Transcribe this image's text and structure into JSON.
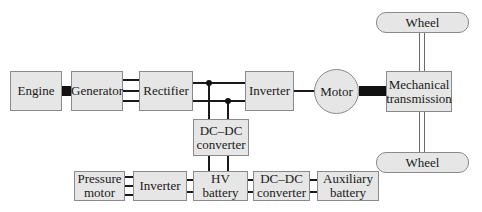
{
  "diagram": {
    "type": "block-diagram",
    "topic": "series hybrid electric vehicle powertrain",
    "blocks": {
      "engine": "Engine",
      "generator": "Generator",
      "rectifier": "Rectifier",
      "inverter_main": "Inverter",
      "motor": "Motor",
      "mech_line1": "Mechanical",
      "mech_line2": "transmission",
      "wheel_top": "Wheel",
      "wheel_bottom": "Wheel",
      "dcdc_mid_line1": "DC–DC",
      "dcdc_mid_line2": "converter",
      "pressure_line1": "Pressure",
      "pressure_line2": "motor",
      "inverter_aux": "Inverter",
      "hv_battery": "HV battery",
      "dcdc_low_line1": "DC–DC",
      "dcdc_low_line2": "converter",
      "aux_line1": "Auxiliary",
      "aux_line2": "battery"
    },
    "connections": [
      {
        "from": "Engine",
        "to": "Generator",
        "kind": "mechanical shaft"
      },
      {
        "from": "Generator",
        "to": "Rectifier",
        "kind": "3-phase AC"
      },
      {
        "from": "Rectifier",
        "to": "Inverter",
        "kind": "DC bus"
      },
      {
        "from": "DC bus",
        "to": "DC–DC converter",
        "kind": "DC"
      },
      {
        "from": "Inverter",
        "to": "Motor",
        "kind": "electrical"
      },
      {
        "from": "Motor",
        "to": "Mechanical transmission",
        "kind": "mechanical shaft"
      },
      {
        "from": "Mechanical transmission",
        "to": "Wheel (top)",
        "kind": "axle"
      },
      {
        "from": "Mechanical transmission",
        "to": "Wheel (bottom)",
        "kind": "axle"
      },
      {
        "from": "DC–DC converter",
        "to": "HV battery",
        "kind": "DC"
      },
      {
        "from": "Pressure motor",
        "to": "Inverter (aux)",
        "kind": "3-phase AC"
      },
      {
        "from": "Inverter (aux)",
        "to": "HV battery",
        "kind": "DC"
      },
      {
        "from": "HV battery",
        "to": "DC–DC converter (low)",
        "kind": "DC"
      },
      {
        "from": "DC–DC converter (low)",
        "to": "Auxiliary battery",
        "kind": "DC"
      }
    ]
  }
}
